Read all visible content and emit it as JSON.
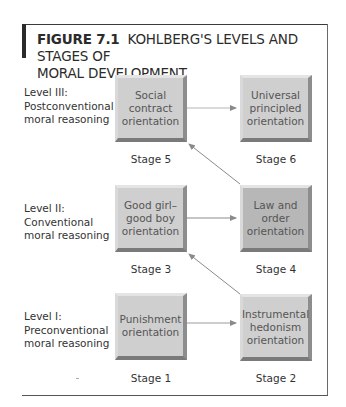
{
  "figure": {
    "number_label": "FIGURE 7.1",
    "title_line1": "KOHLBERG'S LEVELS AND STAGES OF",
    "title_line2": "MORAL DEVELOPMENT"
  },
  "levels": [
    {
      "line1": "Level III:",
      "line2": "Postconventional",
      "line3": "moral reasoning"
    },
    {
      "line1": "Level II:",
      "line2": "Conventional",
      "line3": "moral reasoning"
    },
    {
      "line1": "Level I:",
      "line2": "Preconventional",
      "line3": "moral reasoning"
    }
  ],
  "stages": {
    "s1": {
      "label": "Stage 1",
      "line1": "Punishment",
      "line2": "orientation",
      "line3": ""
    },
    "s2": {
      "label": "Stage 2",
      "line1": "Instrumental",
      "line2": "hedonism",
      "line3": "orientation"
    },
    "s3": {
      "label": "Stage 3",
      "line1": "Good girl–",
      "line2": "good boy",
      "line3": "orientation"
    },
    "s4": {
      "label": "Stage 4",
      "line1": "Law and",
      "line2": "order",
      "line3": "orientation"
    },
    "s5": {
      "label": "Stage 5",
      "line1": "Social",
      "line2": "contract",
      "line3": "orientation"
    },
    "s6": {
      "label": "Stage 6",
      "line1": "Universal",
      "line2": "principled",
      "line3": "orientation"
    }
  },
  "colors": {
    "box_fill": "#cfcfcf",
    "box_fill_dark": "#b7b7b7",
    "arrow": "#8a8a8a",
    "text": "#2b2b2b"
  }
}
